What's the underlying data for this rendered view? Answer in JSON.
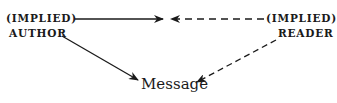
{
  "diagram": {
    "nodes": {
      "author": {
        "line1": "(IMPLIED)",
        "line2": "AUTHOR"
      },
      "reader": {
        "line1": "(IMPLIED)",
        "line2": "READER"
      },
      "message": {
        "label": "Message"
      }
    },
    "edges": [
      {
        "from": "author",
        "to": "center",
        "style": "solid"
      },
      {
        "from": "reader",
        "to": "center",
        "style": "dashed"
      },
      {
        "from": "author",
        "to": "message",
        "style": "solid"
      },
      {
        "from": "reader",
        "to": "message",
        "style": "dashed"
      }
    ],
    "colors": {
      "ink": "#1a1a1a",
      "background": "#ffffff"
    }
  }
}
